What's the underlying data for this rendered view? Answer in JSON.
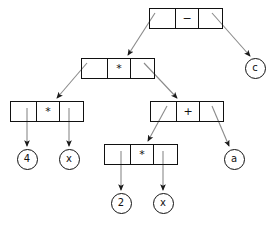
{
  "diagram": {
    "colors": {
      "stroke": "#111111",
      "edge": "#7a7a7a",
      "background": "#ffffff"
    },
    "nodes": [
      {
        "id": "n-minus",
        "type": "operator-box",
        "label": "−",
        "x": 149,
        "y": 8,
        "w": 74,
        "h": 21
      },
      {
        "id": "n-mul-1",
        "type": "operator-box",
        "label": "*",
        "x": 81,
        "y": 58,
        "w": 74,
        "h": 21
      },
      {
        "id": "n-mul-2",
        "type": "operator-box",
        "label": "*",
        "x": 10,
        "y": 101,
        "w": 74,
        "h": 21
      },
      {
        "id": "n-plus",
        "type": "operator-box",
        "label": "+",
        "x": 150,
        "y": 101,
        "w": 74,
        "h": 21
      },
      {
        "id": "n-mul-3",
        "type": "operator-box",
        "label": "*",
        "x": 104,
        "y": 144,
        "w": 74,
        "h": 21
      },
      {
        "id": "leaf-c",
        "type": "leaf-circle",
        "label": "c",
        "cx": 255,
        "cy": 68
      },
      {
        "id": "leaf-4",
        "type": "leaf-circle",
        "label": "4",
        "cx": 27,
        "cy": 159
      },
      {
        "id": "leaf-x-1",
        "type": "leaf-circle",
        "label": "x",
        "cx": 69,
        "cy": 159
      },
      {
        "id": "leaf-a",
        "type": "leaf-circle",
        "label": "a",
        "cx": 234,
        "cy": 159
      },
      {
        "id": "leaf-2",
        "type": "leaf-circle",
        "label": "2",
        "cx": 121,
        "cy": 203
      },
      {
        "id": "leaf-x-2",
        "type": "leaf-circle",
        "label": "x",
        "cx": 163,
        "cy": 203
      }
    ],
    "edges": [
      {
        "from": "n-minus",
        "slot": "left",
        "to": "n-mul-1",
        "x1": 155,
        "y1": 13,
        "x2": 128,
        "y2": 55
      },
      {
        "from": "n-minus",
        "slot": "right",
        "to": "leaf-c",
        "x1": 212,
        "y1": 13,
        "x2": 250,
        "y2": 56
      },
      {
        "from": "n-mul-1",
        "slot": "left",
        "to": "n-mul-2",
        "x1": 87,
        "y1": 63,
        "x2": 57,
        "y2": 98
      },
      {
        "from": "n-mul-1",
        "slot": "right",
        "to": "n-plus",
        "x1": 144,
        "y1": 63,
        "x2": 177,
        "y2": 98
      },
      {
        "from": "n-mul-2",
        "slot": "left",
        "to": "leaf-4",
        "x1": 27,
        "y1": 108,
        "x2": 27,
        "y2": 146
      },
      {
        "from": "n-mul-2",
        "slot": "right",
        "to": "leaf-x-1",
        "x1": 69,
        "y1": 108,
        "x2": 69,
        "y2": 146
      },
      {
        "from": "n-plus",
        "slot": "left",
        "to": "n-mul-3",
        "x1": 167,
        "y1": 106,
        "x2": 148,
        "y2": 141
      },
      {
        "from": "n-plus",
        "slot": "right",
        "to": "leaf-a",
        "x1": 212,
        "y1": 106,
        "x2": 229,
        "y2": 146
      },
      {
        "from": "n-mul-3",
        "slot": "left",
        "to": "leaf-2",
        "x1": 121,
        "y1": 151,
        "x2": 121,
        "y2": 190
      },
      {
        "from": "n-mul-3",
        "slot": "right",
        "to": "leaf-x-2",
        "x1": 163,
        "y1": 151,
        "x2": 163,
        "y2": 190
      }
    ]
  }
}
